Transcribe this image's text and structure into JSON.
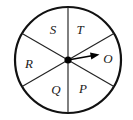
{
  "figure": {
    "type": "spinner-wheel",
    "shape": "circle",
    "sector_count": 6,
    "equal_sectors": true,
    "background_color": "#ffffff",
    "outline_color": "#111111",
    "divider_color": "#222222",
    "hub_color": "#000000",
    "pointer_color": "#000000",
    "circle": {
      "center_x": 68,
      "center_y": 60,
      "radius": 53,
      "stroke_width": 2.2
    },
    "hub": {
      "radius": 3.6
    },
    "pointer": {
      "points_to": "O",
      "angle_degrees": 10,
      "length": 32,
      "head_length": 9,
      "head_width": 7,
      "shaft_width": 1.6
    },
    "dividers": [
      {
        "name": "vertical-divider",
        "angle_degrees": 90
      },
      {
        "name": "diagonal-divider-up-right",
        "angle_degrees": 30
      },
      {
        "name": "diagonal-divider-up-left",
        "angle_degrees": 150
      }
    ],
    "sectors": [
      {
        "id": "T",
        "label": "T",
        "center_angle_degrees": 60,
        "label_x": 80,
        "label_y": 31
      },
      {
        "id": "O",
        "label": "O",
        "center_angle_degrees": 0,
        "label_x": 108,
        "label_y": 60
      },
      {
        "id": "P",
        "label": "P",
        "center_angle_degrees": -60,
        "label_x": 83,
        "label_y": 90
      },
      {
        "id": "Q",
        "label": "Q",
        "center_angle_degrees": -120,
        "label_x": 56,
        "label_y": 91
      },
      {
        "id": "R",
        "label": "R",
        "center_angle_degrees": 180,
        "label_x": 29,
        "label_y": 65
      },
      {
        "id": "S",
        "label": "S",
        "center_angle_degrees": 120,
        "label_x": 53,
        "label_y": 31
      }
    ]
  }
}
